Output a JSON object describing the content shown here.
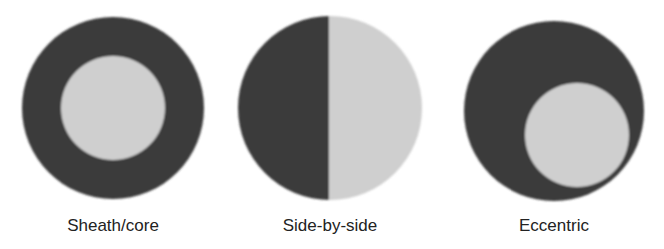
{
  "colors": {
    "dark": "#3a3a3a",
    "light": "#cfcfcf",
    "background": "#ffffff",
    "text": "#222222"
  },
  "diagrams": [
    {
      "label": "Sheath/core",
      "type": "concentric",
      "outer": {
        "cx": 113,
        "cy": 108,
        "r": 91
      },
      "inner": {
        "cx": 113,
        "cy": 108,
        "r": 52
      }
    },
    {
      "label": "Side-by-side",
      "type": "split",
      "outer": {
        "cx": 330,
        "cy": 108,
        "r": 92
      },
      "split_x": 329
    },
    {
      "label": "Eccentric",
      "type": "eccentric",
      "outer": {
        "cx": 554,
        "cy": 111,
        "r": 90
      },
      "inner": {
        "cx": 577,
        "cy": 135,
        "r": 52
      }
    }
  ]
}
